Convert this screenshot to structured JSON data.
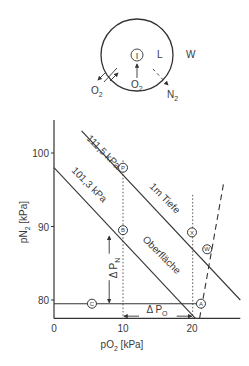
{
  "schematic": {
    "inner_label": "I",
    "region_l": "L",
    "region_w": "W",
    "o2_in_label": "O",
    "o2_in_sub": "2",
    "o2_out_label": "O",
    "o2_out_sub": "2",
    "n2_out_label": "N",
    "n2_out_sub": "2"
  },
  "chart_data": {
    "type": "line",
    "xlabel_main": "pO",
    "xlabel_sub": "2",
    "xlabel_unit": " [kPa]",
    "ylabel_main": "pN",
    "ylabel_sub": "2",
    "ylabel_unit": " [kPa]",
    "xlim": [
      0,
      27
    ],
    "ylim": [
      77.5,
      104.5
    ],
    "x_ticks": [
      {
        "value": 0,
        "label": "0"
      },
      {
        "value": 10,
        "label": "10"
      },
      {
        "value": 20,
        "label": "20"
      }
    ],
    "y_ticks": [
      {
        "value": 80,
        "label": "80"
      },
      {
        "value": 90,
        "label": "90"
      },
      {
        "value": 100,
        "label": "100"
      }
    ],
    "series": [
      {
        "name": "101,3 kPa",
        "label": "101,3 kPa",
        "note": "Oberfläche",
        "points": [
          [
            0,
            98
          ],
          [
            24.3,
            73.7
          ]
        ]
      },
      {
        "name": "111,5 kPa",
        "label": "111,5 kPa",
        "note": "1m Tiefe",
        "points": [
          [
            4,
            103
          ],
          [
            27,
            80
          ]
        ]
      }
    ],
    "line_notes": {
      "surface": "Oberfläche",
      "depth": "1m Tiefe"
    },
    "pressure_labels": {
      "p1013": "101,3 kPa",
      "p1115": "111,5 kPa"
    },
    "dashed_line": {
      "points": [
        [
          21.1,
          77.5
        ],
        [
          24.6,
          96
        ]
      ]
    },
    "horizontal_line": {
      "y": 79.5,
      "x": [
        0,
        21.3
      ]
    },
    "dotted_verticals": [
      {
        "x": 10,
        "y": [
          77.5,
          99
        ]
      },
      {
        "x": 20.1,
        "y": [
          77.5,
          94.3
        ]
      }
    ],
    "points": [
      {
        "label": "C",
        "x": 5.5,
        "y": 79.5
      },
      {
        "label": "A",
        "x": 21.3,
        "y": 79.5
      },
      {
        "label": "B",
        "x": 10,
        "y": 89.5
      },
      {
        "label": "P",
        "x": 10,
        "y": 98
      },
      {
        "label": "X",
        "x": 20,
        "y": 89.2
      },
      {
        "label": "W",
        "x": 22.2,
        "y": 86.9
      }
    ],
    "delta_n": {
      "label": "Δ P",
      "sub": "N",
      "x": 8,
      "y": [
        79.5,
        89.5
      ]
    },
    "delta_o": {
      "label": "Δ P",
      "sub": "O",
      "x": [
        10,
        20.1
      ],
      "y": 77.8
    }
  }
}
